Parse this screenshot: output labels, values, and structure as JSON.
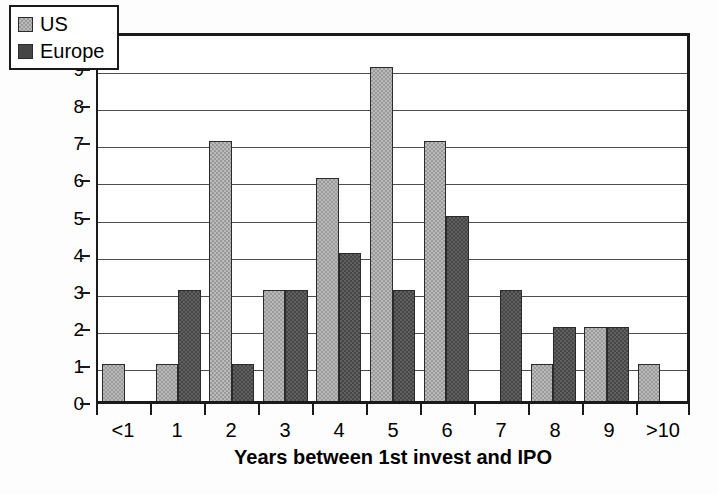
{
  "chart_data": {
    "type": "bar",
    "title": "",
    "xlabel": "Years between 1st invest and IPO",
    "ylabel": "Number",
    "categories": [
      "<1",
      "1",
      "2",
      "3",
      "4",
      "5",
      "6",
      "7",
      "8",
      "9",
      ">10"
    ],
    "series": [
      {
        "name": "US",
        "color": "#9a9a9a",
        "values": [
          1,
          1,
          7,
          3,
          6,
          9,
          7,
          0,
          1,
          2,
          1
        ]
      },
      {
        "name": "Europe",
        "color": "#464646",
        "values": [
          0,
          3,
          1,
          3,
          4,
          3,
          5,
          3,
          2,
          2,
          0
        ]
      }
    ],
    "ylim": [
      0,
      10
    ],
    "yticks": [
      "0",
      "1",
      "2",
      "3",
      "4",
      "5",
      "6",
      "7",
      "8",
      "9",
      "10"
    ],
    "grid": "horizontal",
    "legend_position": "top-left"
  },
  "legend": {
    "items": [
      {
        "label": "US"
      },
      {
        "label": "Europe"
      }
    ]
  }
}
